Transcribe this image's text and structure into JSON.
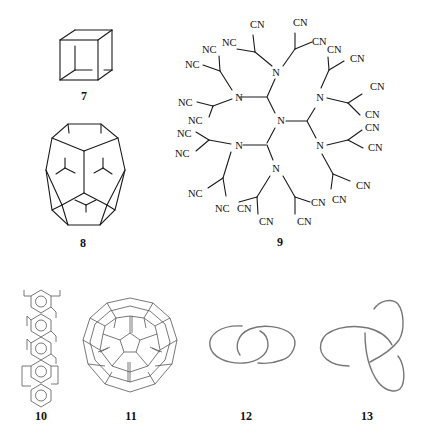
{
  "figure": {
    "compounds": [
      {
        "id": "7",
        "label": "7",
        "name": "cubane"
      },
      {
        "id": "8",
        "label": "8",
        "name": "pentagonal-dodecahedrane-fragment"
      },
      {
        "id": "9",
        "label": "9",
        "name": "cyano-dendrimer"
      },
      {
        "id": "10",
        "label": "10",
        "name": "catenane-ladder"
      },
      {
        "id": "11",
        "label": "11",
        "name": "fullerene-c60"
      },
      {
        "id": "12",
        "label": "12",
        "name": "hopf-link"
      },
      {
        "id": "13",
        "label": "13",
        "name": "trefoil-knot"
      }
    ],
    "atoms": {
      "nitrogen": "N",
      "cyano": "CN",
      "cyano_reversed": "NC"
    }
  }
}
